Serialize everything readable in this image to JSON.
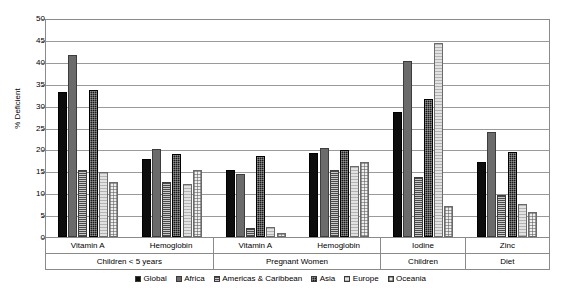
{
  "chart_data": {
    "type": "bar",
    "title": "",
    "xlabel": "",
    "ylabel": "% Deficient",
    "ylim": [
      0,
      50
    ],
    "ytick_step": 5,
    "yticks": [
      "0",
      "5",
      "10",
      "15",
      "20",
      "25",
      "30",
      "35",
      "40",
      "45",
      "50"
    ],
    "grid": true,
    "legend_position": "bottom",
    "categories": [
      "Vitamin A",
      "Hemoglobin",
      "Vitamin A",
      "Hemoglobin",
      "Iodine",
      "Zinc"
    ],
    "supergroups": [
      {
        "label": "Children < 5 years",
        "span": 2
      },
      {
        "label": "Pregnant Women",
        "span": 2
      },
      {
        "label": "Children",
        "span": 1
      },
      {
        "label": "Diet",
        "span": 1
      }
    ],
    "series": [
      {
        "name": "Global",
        "key": "global",
        "values": [
          33.2,
          17.9,
          15.2,
          19.2,
          28.5,
          17.2
        ]
      },
      {
        "name": "Africa",
        "key": "africa",
        "values": [
          41.6,
          20.1,
          14.3,
          20.3,
          40.1,
          23.9
        ]
      },
      {
        "name": "Americas & Caribbean",
        "key": "americas",
        "values": [
          15.4,
          12.6,
          2.0,
          15.2,
          13.7,
          9.7
        ]
      },
      {
        "name": "Asia",
        "key": "asia",
        "values": [
          33.5,
          19.0,
          18.4,
          19.9,
          31.6,
          19.4
        ]
      },
      {
        "name": "Europe",
        "key": "europe",
        "values": [
          14.9,
          12.0,
          2.2,
          16.1,
          44.2,
          7.6
        ]
      },
      {
        "name": "Oceania",
        "key": "oceania",
        "values": [
          12.6,
          15.2,
          1.0,
          17.1,
          7.1,
          5.6
        ]
      }
    ]
  },
  "colors": {
    "global": "#0d0d0d",
    "africa": "#6b6b6b",
    "americas": "#7d7d7d",
    "asia": "#1a1a1a",
    "europe": "#e2e2e2",
    "oceania": "#efefef",
    "grid": "#9a9a9a",
    "axis": "#8a8a8a"
  }
}
